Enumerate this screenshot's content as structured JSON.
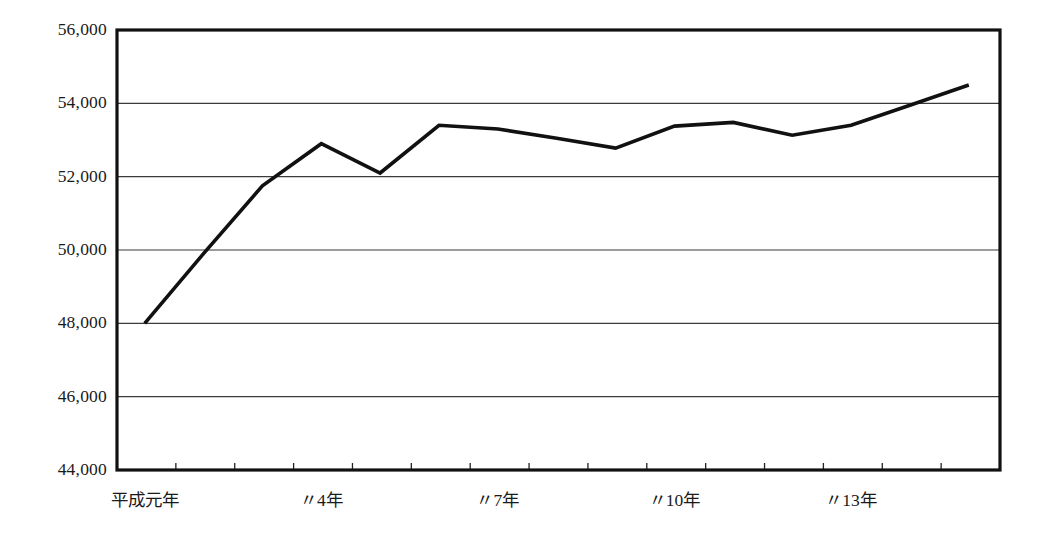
{
  "chart_data": {
    "type": "line",
    "title": "",
    "subtitle": "",
    "xlabel": "",
    "ylabel": "",
    "grid": true,
    "legend": false,
    "legend_position": "none",
    "ylim": [
      44000,
      56000
    ],
    "y_ticks": [
      44000,
      46000,
      48000,
      50000,
      52000,
      54000,
      56000
    ],
    "y_tick_labels": [
      "44,000",
      "46,000",
      "48,000",
      "50,000",
      "52,000",
      "54,000",
      "56,000"
    ],
    "x_tick_labels": [
      "平成元年",
      "〃4年",
      "〃7年",
      "〃10年",
      "〃13年"
    ],
    "x_tick_label_indices": [
      0,
      3,
      6,
      9,
      12
    ],
    "x_minor_tick_count": 15,
    "categories": [
      "平成元年",
      "平成2年",
      "平成3年",
      "平成4年",
      "平成5年",
      "平成6年",
      "平成7年",
      "平成8年",
      "平成9年",
      "平成10年",
      "平成11年",
      "平成12年",
      "平成13年",
      "平成14年",
      "平成15年"
    ],
    "series": [
      {
        "name": "値",
        "values": [
          48000,
          49900,
          51750,
          52900,
          52100,
          53400,
          53300,
          53050,
          52780,
          53380,
          53480,
          53130,
          53400,
          53950,
          54500
        ]
      }
    ],
    "line_color": "#111111",
    "grid_color": "#3b3b3b",
    "axis_color": "#111111",
    "background_color": "#ffffff"
  },
  "axes": {
    "y_labels": [
      "56,000",
      "54,000",
      "52,000",
      "50,000",
      "48,000",
      "46,000",
      "44,000"
    ],
    "x_labels": [
      "平成元年",
      "〃4年",
      "〃7年",
      "〃10年",
      "〃13年"
    ]
  }
}
